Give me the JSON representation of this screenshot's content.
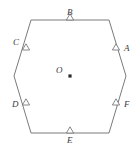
{
  "figure": {
    "type": "geometry-diagram",
    "shape_name": "regular-hexagon",
    "stroke_color": "#6b6b6b",
    "label_color": "#3a3a3a",
    "background_color": "#ffffff",
    "center": {
      "label": "O",
      "marker": "square-dot",
      "x": 70,
      "y": 76
    },
    "hexagon": {
      "vertices": [
        {
          "x": 31,
          "y": 20
        },
        {
          "x": 109,
          "y": 20
        },
        {
          "x": 126,
          "y": 76
        },
        {
          "x": 109,
          "y": 133
        },
        {
          "x": 31,
          "y": 133
        },
        {
          "x": 14,
          "y": 76
        }
      ]
    },
    "edge_markers": [
      {
        "label": "A",
        "marker": "triangle",
        "edge": "upper-right",
        "marker_x": 116,
        "marker_y": 50,
        "label_x": 124,
        "label_y": 44
      },
      {
        "label": "B",
        "marker": "triangle",
        "edge": "top",
        "marker_x": 70,
        "marker_y": 20,
        "label_x": 67,
        "label_y": 8
      },
      {
        "label": "C",
        "marker": "triangle",
        "edge": "upper-left",
        "marker_x": 26,
        "marker_y": 50,
        "label_x": 13,
        "label_y": 38
      },
      {
        "label": "D",
        "marker": "triangle",
        "edge": "lower-left",
        "marker_x": 26,
        "marker_y": 105,
        "label_x": 12,
        "label_y": 100
      },
      {
        "label": "E",
        "marker": "triangle",
        "edge": "bottom",
        "marker_x": 70,
        "marker_y": 133,
        "label_x": 67,
        "label_y": 136
      },
      {
        "label": "F",
        "marker": "triangle",
        "edge": "lower-right",
        "marker_x": 116,
        "marker_y": 105,
        "label_x": 124,
        "label_y": 100
      }
    ]
  }
}
